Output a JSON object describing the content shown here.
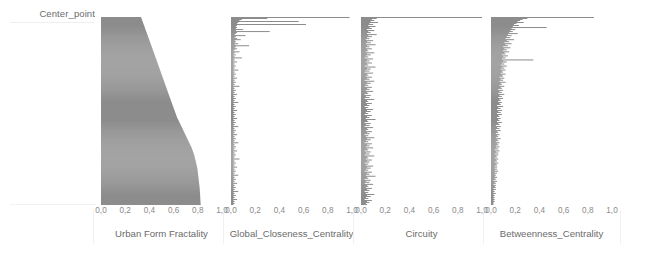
{
  "figure": {
    "row_label": "Center_point",
    "bar_color": "#6e6e6e",
    "text_color": "#6b6b6b",
    "tick_color": "#8a8a8a",
    "background": "#ffffff"
  },
  "chart_data": [
    {
      "type": "bar",
      "orientation": "horizontal",
      "title": "",
      "xlabel": "Urban Form Fractality",
      "ylabel": "Center_point",
      "xlim": [
        0,
        1
      ],
      "xticks": [
        0,
        0.2,
        0.4,
        0.6,
        0.8,
        1
      ],
      "xticklabels": [
        "0,0",
        "0,2",
        "0,4",
        "0,6",
        "0,8",
        "1,0"
      ],
      "grid": false,
      "legend": "none",
      "note": "Sorted observations, values rise monotonically from ~0.33 at the bottom to ~0.82 at the top forming a dense filled S-curve",
      "values": [
        0.332,
        0.335,
        0.338,
        0.341,
        0.344,
        0.347,
        0.35,
        0.353,
        0.356,
        0.359,
        0.362,
        0.365,
        0.368,
        0.371,
        0.374,
        0.377,
        0.38,
        0.383,
        0.386,
        0.389,
        0.392,
        0.395,
        0.398,
        0.401,
        0.404,
        0.407,
        0.41,
        0.413,
        0.416,
        0.419,
        0.422,
        0.425,
        0.428,
        0.431,
        0.434,
        0.437,
        0.44,
        0.443,
        0.446,
        0.449,
        0.452,
        0.455,
        0.458,
        0.461,
        0.464,
        0.467,
        0.47,
        0.473,
        0.476,
        0.479,
        0.482,
        0.485,
        0.488,
        0.491,
        0.494,
        0.497,
        0.5,
        0.503,
        0.506,
        0.509,
        0.512,
        0.515,
        0.518,
        0.521,
        0.524,
        0.527,
        0.53,
        0.533,
        0.536,
        0.539,
        0.542,
        0.545,
        0.548,
        0.551,
        0.554,
        0.557,
        0.56,
        0.563,
        0.566,
        0.569,
        0.572,
        0.575,
        0.578,
        0.581,
        0.584,
        0.587,
        0.59,
        0.593,
        0.596,
        0.599,
        0.602,
        0.605,
        0.608,
        0.611,
        0.614,
        0.617,
        0.62,
        0.623,
        0.626,
        0.629,
        0.633,
        0.637,
        0.641,
        0.645,
        0.649,
        0.653,
        0.657,
        0.661,
        0.665,
        0.669,
        0.673,
        0.677,
        0.681,
        0.685,
        0.689,
        0.693,
        0.697,
        0.701,
        0.705,
        0.709,
        0.713,
        0.717,
        0.721,
        0.725,
        0.729,
        0.733,
        0.737,
        0.741,
        0.745,
        0.749,
        0.752,
        0.755,
        0.758,
        0.761,
        0.764,
        0.767,
        0.77,
        0.772,
        0.774,
        0.776,
        0.778,
        0.78,
        0.782,
        0.784,
        0.786,
        0.788,
        0.79,
        0.792,
        0.794,
        0.796,
        0.797,
        0.798,
        0.799,
        0.8,
        0.801,
        0.802,
        0.803,
        0.804,
        0.805,
        0.806,
        0.807,
        0.808,
        0.809,
        0.81,
        0.811,
        0.812,
        0.813,
        0.814,
        0.815,
        0.816,
        0.816,
        0.817,
        0.817,
        0.818,
        0.818,
        0.819,
        0.819,
        0.82,
        0.82,
        0.821,
        0.821,
        0.822,
        0.822,
        0.823,
        0.823,
        0.824
      ]
    },
    {
      "type": "bar",
      "orientation": "horizontal",
      "title": "",
      "xlabel": "Global_Closeness_Centrality",
      "ylabel": "Center_point",
      "xlim": [
        0,
        1
      ],
      "xticks": [
        0,
        0.2,
        0.4,
        0.6,
        0.8,
        1
      ],
      "xticklabels": [
        "0,0",
        "0,2",
        "0,4",
        "0,6",
        "0,8",
        "1,0"
      ],
      "grid": false,
      "legend": "none",
      "note": "Mostly very small values (<0.1) with a dense spiky base; a handful of long bars near the top reaching 0.55-1.0",
      "values": [
        0.98,
        0.3,
        0.09,
        0.07,
        0.56,
        0.06,
        0.05,
        0.62,
        0.05,
        0.04,
        0.05,
        0.04,
        0.1,
        0.04,
        0.32,
        0.05,
        0.04,
        0.03,
        0.12,
        0.04,
        0.03,
        0.05,
        0.08,
        0.03,
        0.04,
        0.03,
        0.06,
        0.03,
        0.15,
        0.04,
        0.03,
        0.05,
        0.03,
        0.02,
        0.07,
        0.03,
        0.02,
        0.04,
        0.02,
        0.03,
        0.09,
        0.02,
        0.03,
        0.02,
        0.05,
        0.02,
        0.03,
        0.02,
        0.04,
        0.02,
        0.03,
        0.02,
        0.06,
        0.02,
        0.03,
        0.02,
        0.04,
        0.02,
        0.03,
        0.02,
        0.05,
        0.02,
        0.03,
        0.02,
        0.04,
        0.02,
        0.03,
        0.02,
        0.07,
        0.02,
        0.03,
        0.02,
        0.04,
        0.02,
        0.03,
        0.02,
        0.05,
        0.02,
        0.03,
        0.02,
        0.04,
        0.02,
        0.03,
        0.02,
        0.06,
        0.02,
        0.03,
        0.02,
        0.04,
        0.02,
        0.03,
        0.02,
        0.05,
        0.02,
        0.03,
        0.02,
        0.04,
        0.02,
        0.03,
        0.02,
        0.05,
        0.02,
        0.03,
        0.02,
        0.04,
        0.02,
        0.03,
        0.02,
        0.06,
        0.02,
        0.03,
        0.02,
        0.04,
        0.02,
        0.03,
        0.02,
        0.05,
        0.02,
        0.03,
        0.02,
        0.04,
        0.02,
        0.03,
        0.02,
        0.06,
        0.02,
        0.03,
        0.02,
        0.04,
        0.02,
        0.03,
        0.02,
        0.05,
        0.02,
        0.03,
        0.02,
        0.04,
        0.02,
        0.03,
        0.02,
        0.07,
        0.02,
        0.03,
        0.02,
        0.04,
        0.02,
        0.03,
        0.02,
        0.05,
        0.02,
        0.03,
        0.02,
        0.04,
        0.02,
        0.03,
        0.02,
        0.06,
        0.02,
        0.03,
        0.02,
        0.04,
        0.02,
        0.03,
        0.02,
        0.05,
        0.02,
        0.03,
        0.02,
        0.04,
        0.02,
        0.03,
        0.02,
        0.06,
        0.02,
        0.03,
        0.02,
        0.04,
        0.02,
        0.03,
        0.02,
        0.05,
        0.02,
        0.03,
        0.02,
        0.03,
        0.02
      ]
    },
    {
      "type": "bar",
      "orientation": "horizontal",
      "title": "",
      "xlabel": "Circuity",
      "ylabel": "Center_point",
      "xlim": [
        0,
        1
      ],
      "xticks": [
        0,
        0.2,
        0.4,
        0.6,
        0.8,
        1
      ],
      "xticklabels": [
        "0,0",
        "0,2",
        "0,4",
        "0,6",
        "0,8",
        "1,0"
      ],
      "grid": false,
      "legend": "none",
      "note": "Narrow spiky distribution concentrated under 0.15 with one long bar near 1.0 at the top",
      "values": [
        1.0,
        0.13,
        0.09,
        0.11,
        0.08,
        0.14,
        0.07,
        0.1,
        0.06,
        0.12,
        0.07,
        0.09,
        0.05,
        0.11,
        0.06,
        0.08,
        0.05,
        0.13,
        0.06,
        0.09,
        0.05,
        0.07,
        0.04,
        0.1,
        0.05,
        0.08,
        0.04,
        0.12,
        0.05,
        0.07,
        0.04,
        0.09,
        0.05,
        0.06,
        0.04,
        0.11,
        0.05,
        0.08,
        0.04,
        0.06,
        0.03,
        0.1,
        0.05,
        0.07,
        0.04,
        0.09,
        0.05,
        0.06,
        0.03,
        0.12,
        0.05,
        0.08,
        0.04,
        0.07,
        0.03,
        0.1,
        0.05,
        0.06,
        0.04,
        0.09,
        0.05,
        0.07,
        0.03,
        0.11,
        0.05,
        0.08,
        0.04,
        0.06,
        0.03,
        0.09,
        0.05,
        0.07,
        0.04,
        0.1,
        0.05,
        0.06,
        0.03,
        0.08,
        0.04,
        0.07,
        0.03,
        0.11,
        0.05,
        0.06,
        0.04,
        0.09,
        0.05,
        0.07,
        0.03,
        0.06,
        0.04,
        0.1,
        0.05,
        0.08,
        0.04,
        0.06,
        0.03,
        0.09,
        0.05,
        0.07,
        0.04,
        0.12,
        0.05,
        0.06,
        0.03,
        0.08,
        0.04,
        0.07,
        0.03,
        0.1,
        0.05,
        0.06,
        0.04,
        0.09,
        0.05,
        0.07,
        0.03,
        0.06,
        0.04,
        0.11,
        0.05,
        0.08,
        0.04,
        0.06,
        0.03,
        0.09,
        0.05,
        0.07,
        0.04,
        0.1,
        0.05,
        0.06,
        0.03,
        0.08,
        0.04,
        0.07,
        0.03,
        0.11,
        0.05,
        0.06,
        0.04,
        0.09,
        0.05,
        0.07,
        0.03,
        0.06,
        0.04,
        0.1,
        0.05,
        0.08,
        0.04,
        0.06,
        0.03,
        0.09,
        0.05,
        0.07,
        0.04,
        0.12,
        0.05,
        0.06,
        0.03,
        0.08,
        0.04,
        0.07,
        0.03,
        0.1,
        0.05,
        0.06,
        0.04,
        0.09,
        0.05,
        0.07,
        0.03,
        0.06,
        0.04,
        0.11,
        0.05,
        0.08,
        0.04,
        0.06,
        0.03,
        0.09,
        0.05,
        0.07,
        0.04,
        0.05
      ]
    },
    {
      "type": "bar",
      "orientation": "horizontal",
      "title": "",
      "xlabel": "Betweenness_Centrality",
      "ylabel": "Center_point",
      "xlim": [
        0,
        1
      ],
      "xticks": [
        0,
        0.2,
        0.4,
        0.6,
        0.8,
        1
      ],
      "xticklabels": [
        "0,0",
        "0,2",
        "0,4",
        "0,6",
        "0,8",
        "1,0"
      ],
      "grid": false,
      "legend": "none",
      "note": "Dense base widening toward the top; several long bars reaching 0.35-0.85, maximum ~0.85 at the top",
      "values": [
        0.85,
        0.3,
        0.26,
        0.24,
        0.22,
        0.27,
        0.21,
        0.19,
        0.23,
        0.18,
        0.46,
        0.17,
        0.2,
        0.16,
        0.18,
        0.15,
        0.22,
        0.14,
        0.17,
        0.13,
        0.16,
        0.12,
        0.19,
        0.13,
        0.15,
        0.11,
        0.17,
        0.12,
        0.14,
        0.1,
        0.16,
        0.11,
        0.13,
        0.1,
        0.15,
        0.11,
        0.12,
        0.09,
        0.14,
        0.1,
        0.12,
        0.09,
        0.35,
        0.1,
        0.13,
        0.09,
        0.11,
        0.08,
        0.13,
        0.09,
        0.11,
        0.08,
        0.12,
        0.09,
        0.1,
        0.08,
        0.12,
        0.09,
        0.1,
        0.07,
        0.11,
        0.08,
        0.1,
        0.07,
        0.12,
        0.08,
        0.09,
        0.07,
        0.11,
        0.08,
        0.09,
        0.06,
        0.1,
        0.07,
        0.09,
        0.06,
        0.11,
        0.07,
        0.09,
        0.06,
        0.1,
        0.07,
        0.08,
        0.06,
        0.09,
        0.07,
        0.08,
        0.05,
        0.1,
        0.06,
        0.08,
        0.05,
        0.09,
        0.06,
        0.08,
        0.05,
        0.09,
        0.06,
        0.07,
        0.05,
        0.08,
        0.06,
        0.07,
        0.05,
        0.09,
        0.06,
        0.07,
        0.04,
        0.08,
        0.05,
        0.07,
        0.04,
        0.08,
        0.05,
        0.06,
        0.04,
        0.07,
        0.05,
        0.06,
        0.04,
        0.08,
        0.05,
        0.06,
        0.04,
        0.07,
        0.05,
        0.06,
        0.04,
        0.07,
        0.04,
        0.06,
        0.03,
        0.07,
        0.04,
        0.06,
        0.03,
        0.06,
        0.04,
        0.05,
        0.03,
        0.06,
        0.04,
        0.05,
        0.03,
        0.06,
        0.04,
        0.05,
        0.03,
        0.05,
        0.03,
        0.05,
        0.03,
        0.06,
        0.03,
        0.05,
        0.03,
        0.04,
        0.03,
        0.05,
        0.03,
        0.04,
        0.02,
        0.05,
        0.03,
        0.04,
        0.02,
        0.04,
        0.03,
        0.04,
        0.02,
        0.04,
        0.02,
        0.03,
        0.02,
        0.04,
        0.02,
        0.03,
        0.02,
        0.03,
        0.02,
        0.03,
        0.02,
        0.03,
        0.02,
        0.02,
        0.02
      ]
    }
  ],
  "panels": [
    {
      "xlabel": "Urban Form Fractality"
    },
    {
      "xlabel": "Global_Closeness_Centrality"
    },
    {
      "xlabel": "Circuity"
    },
    {
      "xlabel": "Betweenness_Centrality"
    }
  ]
}
